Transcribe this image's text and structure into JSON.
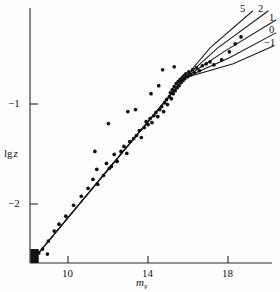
{
  "figure": {
    "name": "log-z-vs-visual-magnitude-scatter",
    "background_color": "#fdfdfd",
    "ink_color": "#111111"
  },
  "axes": {
    "x": {
      "title_main": "m",
      "title_sub": "v",
      "ticks": [
        {
          "value": 10,
          "label": "10"
        },
        {
          "value": 14,
          "label": "14"
        },
        {
          "value": 18,
          "label": "18"
        }
      ],
      "range": [
        8.1,
        20.6
      ]
    },
    "y": {
      "title_main": "lg",
      "title_var": "z",
      "ticks": [
        {
          "value": -1,
          "label": "−1"
        },
        {
          "value": -2,
          "label": "−2"
        }
      ],
      "range": [
        -2.72,
        -0.16
      ]
    }
  },
  "curve_labels": [
    {
      "id": "q5",
      "label": "5"
    },
    {
      "id": "q2",
      "label": "2"
    },
    {
      "id": "q1",
      "label": "1"
    },
    {
      "id": "q0",
      "label": "0"
    },
    {
      "id": "qm1",
      "label": "−1"
    }
  ],
  "chart_data": {
    "type": "scatter",
    "title": "",
    "xlabel": "m_v",
    "ylabel": "lg z",
    "xlim": [
      8.1,
      20.6
    ],
    "ylim": [
      -2.72,
      -0.16
    ],
    "grid": false,
    "legend": "curve labels at upper right (q0 values)",
    "annotations": [
      {
        "text": "5",
        "x": 19.8,
        "y": -0.24
      },
      {
        "text": "2",
        "x": 20.65,
        "y": -0.24
      },
      {
        "text": "1",
        "x": 21.15,
        "y": -0.33
      },
      {
        "text": "0",
        "x": 21.15,
        "y": -0.45
      },
      {
        "text": "−1",
        "x": 21.0,
        "y": -0.58
      }
    ],
    "series": [
      {
        "name": "observed clusters",
        "type": "scatter",
        "marker": "filled-circle",
        "points": [
          [
            8.25,
            -2.66
          ],
          [
            8.35,
            -2.7
          ],
          [
            8.55,
            -2.62
          ],
          [
            8.75,
            -2.58
          ],
          [
            9.05,
            -2.5
          ],
          [
            9.35,
            -2.4
          ],
          [
            9.6,
            -2.33
          ],
          [
            9.95,
            -2.25
          ],
          [
            10.35,
            -2.14
          ],
          [
            10.75,
            -2.05
          ],
          [
            11.1,
            -1.97
          ],
          [
            11.35,
            -1.88
          ],
          [
            11.55,
            -1.78
          ],
          [
            11.6,
            -1.93
          ],
          [
            11.9,
            -1.84
          ],
          [
            12.05,
            -1.72
          ],
          [
            12.2,
            -1.77
          ],
          [
            12.3,
            -1.75
          ],
          [
            12.45,
            -1.63
          ],
          [
            12.6,
            -1.7
          ],
          [
            12.8,
            -1.6
          ],
          [
            12.95,
            -1.55
          ],
          [
            13.1,
            -1.62
          ],
          [
            13.25,
            -1.5
          ],
          [
            13.45,
            -1.47
          ],
          [
            13.6,
            -1.44
          ],
          [
            13.75,
            -1.39
          ],
          [
            13.85,
            -1.46
          ],
          [
            14.0,
            -1.36
          ],
          [
            14.1,
            -1.3
          ],
          [
            14.2,
            -1.33
          ],
          [
            14.3,
            -1.27
          ],
          [
            14.4,
            -1.31
          ],
          [
            14.5,
            -1.24
          ],
          [
            14.6,
            -1.21
          ],
          [
            14.7,
            -1.25
          ],
          [
            14.8,
            -1.18
          ],
          [
            14.9,
            -1.15
          ],
          [
            15.0,
            -1.2
          ],
          [
            15.05,
            -1.11
          ],
          [
            15.15,
            -1.08
          ],
          [
            15.2,
            -1.13
          ],
          [
            15.3,
            -1.05
          ],
          [
            15.35,
            -1.01
          ],
          [
            15.4,
            -1.07
          ],
          [
            15.45,
            -0.98
          ],
          [
            15.5,
            -1.02
          ],
          [
            15.55,
            -0.95
          ],
          [
            15.6,
            -0.99
          ],
          [
            15.65,
            -0.92
          ],
          [
            15.7,
            -0.96
          ],
          [
            15.75,
            -0.9
          ],
          [
            15.8,
            -0.94
          ],
          [
            15.85,
            -0.88
          ],
          [
            15.9,
            -0.91
          ],
          [
            15.95,
            -0.86
          ],
          [
            16.0,
            -0.89
          ],
          [
            16.05,
            -0.84
          ],
          [
            16.1,
            -0.87
          ],
          [
            16.15,
            -0.82
          ],
          [
            16.25,
            -0.85
          ],
          [
            16.3,
            -0.8
          ],
          [
            16.4,
            -0.83
          ],
          [
            16.5,
            -0.78
          ],
          [
            16.6,
            -0.81
          ],
          [
            16.7,
            -0.76
          ],
          [
            16.85,
            -0.79
          ],
          [
            17.0,
            -0.74
          ],
          [
            17.2,
            -0.72
          ],
          [
            17.4,
            -0.7
          ],
          [
            17.6,
            -0.73
          ],
          [
            18.0,
            -0.68
          ],
          [
            18.4,
            -0.6
          ],
          [
            18.7,
            -0.52
          ],
          [
            19.0,
            -0.45
          ],
          [
            14.95,
            -0.78
          ],
          [
            15.55,
            -0.75
          ],
          [
            11.45,
            -1.6
          ],
          [
            12.15,
            -1.32
          ],
          [
            13.15,
            -1.2
          ],
          [
            13.55,
            -1.18
          ],
          [
            14.35,
            -1.02
          ],
          [
            14.75,
            -0.94
          ],
          [
            9.0,
            -2.63
          ]
        ]
      },
      {
        "name": "q0 = 5",
        "type": "line",
        "label": "5",
        "points": [
          [
            8.2,
            -2.7
          ],
          [
            13.0,
            -1.58
          ],
          [
            16.1,
            -0.86
          ],
          [
            17.4,
            -0.56
          ],
          [
            19.6,
            -0.19
          ]
        ]
      },
      {
        "name": "q0 = 2",
        "type": "line",
        "label": "2",
        "points": [
          [
            8.2,
            -2.7
          ],
          [
            13.0,
            -1.58
          ],
          [
            16.1,
            -0.86
          ],
          [
            17.8,
            -0.56
          ],
          [
            20.4,
            -0.19
          ]
        ]
      },
      {
        "name": "q0 = 1",
        "type": "line",
        "label": "1",
        "points": [
          [
            8.2,
            -2.7
          ],
          [
            13.0,
            -1.58
          ],
          [
            16.1,
            -0.86
          ],
          [
            18.1,
            -0.6
          ],
          [
            20.8,
            -0.28
          ]
        ]
      },
      {
        "name": "q0 = 0",
        "type": "line",
        "label": "0",
        "points": [
          [
            8.2,
            -2.7
          ],
          [
            13.0,
            -1.58
          ],
          [
            16.1,
            -0.86
          ],
          [
            18.4,
            -0.66
          ],
          [
            20.8,
            -0.41
          ]
        ]
      },
      {
        "name": "q0 = -1",
        "type": "line",
        "label": "−1",
        "points": [
          [
            8.2,
            -2.7
          ],
          [
            13.0,
            -1.58
          ],
          [
            16.1,
            -0.86
          ],
          [
            18.6,
            -0.72
          ],
          [
            20.7,
            -0.54
          ]
        ]
      }
    ],
    "dense_block": {
      "description": "solid filled rectangle of overlapping faint points near origin",
      "x_range": [
        8.12,
        8.55
      ],
      "y_range": [
        -2.72,
        -2.58
      ]
    }
  }
}
